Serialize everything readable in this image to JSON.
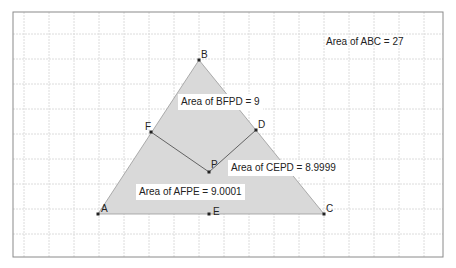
{
  "frame": {
    "x": 13,
    "y": 12,
    "w": 430,
    "h": 245,
    "border": "#8a8a8a",
    "grid_color": "#dcdcdc",
    "grid_step": 25
  },
  "colors": {
    "fill": "#d9d9d9",
    "stroke": "#999999",
    "segment": "#555555",
    "point": "#222222"
  },
  "points": {
    "A": {
      "x": 98,
      "y": 214,
      "label": "A",
      "lx": 101,
      "ly": 203
    },
    "B": {
      "x": 199,
      "y": 60,
      "label": "B",
      "lx": 201,
      "ly": 49
    },
    "C": {
      "x": 324,
      "y": 214,
      "label": "C",
      "lx": 326,
      "ly": 203
    },
    "D": {
      "x": 256,
      "y": 130,
      "label": "D",
      "lx": 258,
      "ly": 119
    },
    "E": {
      "x": 209,
      "y": 214,
      "label": "E",
      "lx": 213,
      "ly": 206
    },
    "F": {
      "x": 151,
      "y": 132,
      "label": "F",
      "lx": 145,
      "ly": 121
    },
    "P": {
      "x": 209,
      "y": 172,
      "label": "P",
      "lx": 211,
      "ly": 159
    }
  },
  "areas": {
    "abc": {
      "text": "Area of  ABC = 27",
      "x": 326,
      "y": 36
    },
    "bfpd": {
      "text": "Area of  BFPD = 9",
      "x": 181,
      "y": 96
    },
    "cepd": {
      "text": "Area of  CEPD = 8.9999",
      "x": 231,
      "y": 162
    },
    "afpe": {
      "text": "Area of  AFPE = 9.0001",
      "x": 139,
      "y": 186
    }
  }
}
